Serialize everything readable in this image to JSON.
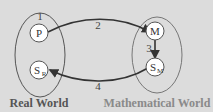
{
  "diagram": {
    "worlds": {
      "real": {
        "label": "Real World",
        "step_label": "1"
      },
      "math": {
        "label": "Mathematical World"
      }
    },
    "nodes": {
      "P": {
        "main": "P",
        "sub": ""
      },
      "SR": {
        "main": "S",
        "sub": "R"
      },
      "M": {
        "main": "M",
        "sub": ""
      },
      "SM": {
        "main": "S",
        "sub": "M"
      }
    },
    "edges": [
      {
        "from": "P",
        "to": "M",
        "label": "2"
      },
      {
        "from": "M",
        "to": "SM",
        "label": "3"
      },
      {
        "from": "SM",
        "to": "SR",
        "label": "4"
      }
    ],
    "colors": {
      "background": "#dcdcdc",
      "node_fill": "#ffffff",
      "stroke": "#444444",
      "real_label": "#555555",
      "math_label": "#8a8a8a"
    }
  }
}
